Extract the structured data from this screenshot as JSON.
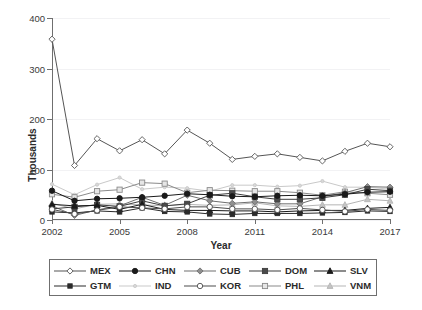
{
  "chart_data": {
    "type": "line",
    "title": "",
    "xlabel": "Year",
    "ylabel": "Thousands",
    "xlim": [
      2002,
      2017
    ],
    "ylim": [
      0,
      400
    ],
    "yticks": [
      0,
      100,
      200,
      300,
      400
    ],
    "xticks": [
      2002,
      2005,
      2008,
      2011,
      2014,
      2017
    ],
    "grid": true,
    "legend_position": "bottom",
    "x": [
      2002,
      2003,
      2004,
      2005,
      2006,
      2007,
      2008,
      2009,
      2010,
      2011,
      2012,
      2013,
      2014,
      2015,
      2016,
      2017
    ],
    "series": [
      {
        "name": "MEX",
        "marker": "open-diamond",
        "color": "#555555",
        "marker_fill": "#ffffff",
        "values": [
          358,
          108,
          161,
          137,
          159,
          131,
          178,
          152,
          120,
          126,
          131,
          124,
          117,
          136,
          152,
          145
        ]
      },
      {
        "name": "CHN",
        "marker": "filled-circle",
        "color": "#1a1a1a",
        "marker_fill": "#1a1a1a",
        "values": [
          58,
          38,
          42,
          43,
          45,
          48,
          52,
          50,
          47,
          46,
          48,
          49,
          48,
          51,
          55,
          56
        ]
      },
      {
        "name": "CUB",
        "marker": "filled-diamond",
        "color": "#6e6e6e",
        "marker_fill": "#8f8f8f",
        "values": [
          28,
          9,
          20,
          28,
          45,
          29,
          49,
          38,
          33,
          36,
          32,
          32,
          46,
          54,
          66,
          65
        ]
      },
      {
        "name": "DOM",
        "marker": "filled-square",
        "color": "#3d3d3d",
        "marker_fill": "#4a4a4a",
        "values": [
          22,
          26,
          30,
          27,
          38,
          28,
          32,
          49,
          53,
          46,
          41,
          41,
          44,
          50,
          61,
          58
        ]
      },
      {
        "name": "SLV",
        "marker": "filled-triangle",
        "color": "#1a1a1a",
        "marker_fill": "#1a1a1a",
        "values": [
          31,
          28,
          29,
          21,
          31,
          21,
          19,
          19,
          18,
          18,
          16,
          18,
          19,
          19,
          23,
          25
        ]
      },
      {
        "name": "GTM",
        "marker": "small-star",
        "color": "#2b2b2b",
        "marker_fill": "#2b2b2b",
        "values": [
          16,
          14,
          18,
          16,
          24,
          17,
          16,
          12,
          11,
          13,
          13,
          13,
          14,
          15,
          18,
          17
        ]
      },
      {
        "name": "IND",
        "marker": "faint-dot",
        "color": "#c9c9c9",
        "marker_fill": "#d8d8d8",
        "values": [
          71,
          50,
          70,
          84,
          61,
          65,
          63,
          57,
          69,
          69,
          66,
          68,
          77,
          65,
          65,
          61
        ]
      },
      {
        "name": "KOR",
        "marker": "open-circle",
        "color": "#4d4d4d",
        "marker_fill": "#ffffff",
        "values": [
          21,
          12,
          19,
          26,
          24,
          22,
          26,
          26,
          22,
          22,
          20,
          23,
          20,
          17,
          21,
          19
        ]
      },
      {
        "name": "PHL",
        "marker": "open-square",
        "color": "#8a8a8a",
        "marker_fill": "#e6e6e6",
        "values": [
          51,
          45,
          57,
          60,
          74,
          72,
          54,
          59,
          58,
          57,
          57,
          54,
          49,
          56,
          53,
          50
        ]
      },
      {
        "name": "VNM",
        "marker": "light-triangle",
        "color": "#b5b5b5",
        "marker_fill": "#c4c4c4",
        "values": [
          33,
          22,
          31,
          32,
          30,
          28,
          31,
          29,
          30,
          34,
          28,
          27,
          30,
          30,
          41,
          38
        ]
      }
    ]
  },
  "axes": {
    "ylabel": "Thousands",
    "xlabel": "Year",
    "ytick_labels": [
      "0",
      "100",
      "200",
      "300",
      "400"
    ],
    "xtick_labels": [
      "2002",
      "2005",
      "2008",
      "2011",
      "2014",
      "2017"
    ]
  },
  "legend": {
    "rows": [
      [
        "MEX",
        "CHN",
        "CUB",
        "DOM",
        "SLV"
      ],
      [
        "GTM",
        "IND",
        "KOR",
        "PHL",
        "VNM"
      ]
    ]
  }
}
